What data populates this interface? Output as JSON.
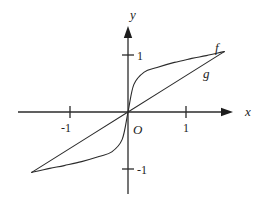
{
  "figure": {
    "labels": {
      "x_axis": "x",
      "y_axis": "y",
      "origin": "O",
      "curve_f": "f",
      "curve_g": "g",
      "x_tick_neg": "-1",
      "x_tick_pos": "1",
      "y_tick_pos": "1",
      "y_tick_neg": "-1"
    },
    "colors": {
      "background": "#ffffff",
      "stroke": "#2b2b2b"
    }
  },
  "chart_data": {
    "type": "line",
    "title": "",
    "xlabel": "x",
    "ylabel": "y",
    "origin_label": "O",
    "x_ticks": [
      -1,
      1
    ],
    "y_ticks": [
      -1,
      1
    ],
    "xlim": [
      -1.9,
      2.25
    ],
    "ylim": [
      -1.65,
      1.5
    ],
    "grid": false,
    "legend_position": "inline labels at right ends of curves (f above, g below)",
    "series": [
      {
        "name": "f",
        "shape": "odd S-shaped curve through origin, nearly vertical at O, flattening toward y = ±1 at the ends",
        "points": [
          [
            -1.66,
            -1.06
          ],
          [
            -1.35,
            -0.99
          ],
          [
            -1.1,
            -0.94
          ],
          [
            -0.8,
            -0.87
          ],
          [
            -0.5,
            -0.78
          ],
          [
            -0.28,
            -0.7
          ],
          [
            -0.1,
            -0.48
          ],
          [
            0,
            0
          ],
          [
            0.1,
            0.48
          ],
          [
            0.28,
            0.7
          ],
          [
            0.5,
            0.78
          ],
          [
            0.8,
            0.87
          ],
          [
            1.1,
            0.94
          ],
          [
            1.35,
            0.99
          ],
          [
            1.66,
            1.06
          ]
        ]
      },
      {
        "name": "g",
        "shape": "straight line through the origin meeting curve f at both endpoints",
        "points": [
          [
            -1.66,
            -1.06
          ],
          [
            0,
            0
          ],
          [
            1.66,
            1.06
          ]
        ]
      }
    ]
  }
}
